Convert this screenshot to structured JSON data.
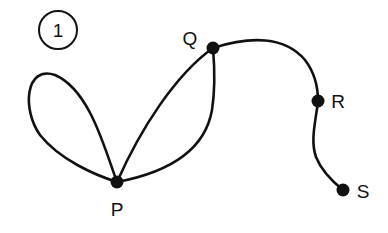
{
  "figure": {
    "number_label": "1"
  },
  "graph": {
    "vertices": [
      {
        "id": "P",
        "label": "P"
      },
      {
        "id": "Q",
        "label": "Q"
      },
      {
        "id": "R",
        "label": "R"
      },
      {
        "id": "S",
        "label": "S"
      }
    ],
    "edges": [
      {
        "from": "P",
        "to": "P",
        "type": "loop"
      },
      {
        "from": "P",
        "to": "Q",
        "type": "edge"
      },
      {
        "from": "P",
        "to": "Q",
        "type": "edge"
      },
      {
        "from": "Q",
        "to": "R",
        "type": "edge"
      },
      {
        "from": "R",
        "to": "S",
        "type": "edge"
      }
    ]
  },
  "colors": {
    "stroke": "#111111",
    "background": "#ffffff"
  }
}
